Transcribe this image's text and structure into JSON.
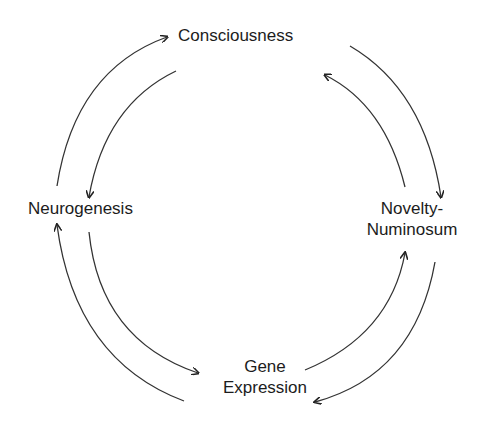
{
  "diagram": {
    "type": "cycle",
    "nodes": [
      {
        "id": "consciousness",
        "lines": [
          "Consciousness"
        ]
      },
      {
        "id": "neurogenesis",
        "lines": [
          "Neurogenesis"
        ]
      },
      {
        "id": "novelty",
        "lines": [
          "Novelty-",
          "Numinosum"
        ]
      },
      {
        "id": "gene",
        "lines": [
          "Gene",
          "Expression"
        ]
      }
    ],
    "edges": [
      {
        "from": "neurogenesis",
        "to": "consciousness"
      },
      {
        "from": "consciousness",
        "to": "neurogenesis"
      },
      {
        "from": "consciousness",
        "to": "novelty"
      },
      {
        "from": "novelty",
        "to": "consciousness"
      },
      {
        "from": "gene",
        "to": "neurogenesis"
      },
      {
        "from": "neurogenesis",
        "to": "gene"
      },
      {
        "from": "gene",
        "to": "novelty"
      },
      {
        "from": "novelty",
        "to": "gene"
      }
    ],
    "colors": {
      "line": "#333333",
      "text": "#1c1c1c",
      "background": "#ffffff"
    }
  }
}
